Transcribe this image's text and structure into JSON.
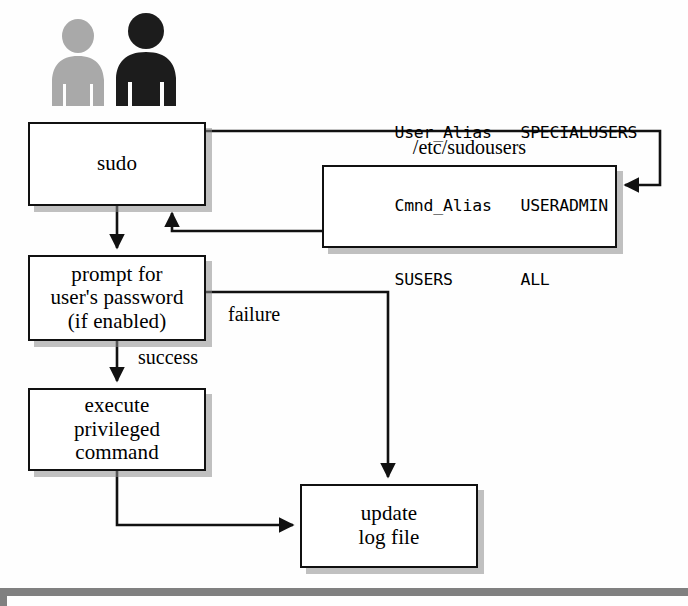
{
  "diagram": {
    "actors": [
      {
        "name": "user-light",
        "tone": "#a8a8a8"
      },
      {
        "name": "user-dark",
        "tone": "#1a1a1a"
      }
    ],
    "nodes": {
      "sudo": {
        "lines": [
          "sudo"
        ]
      },
      "prompt": {
        "lines": [
          "prompt for",
          "user's password",
          "(if enabled)"
        ]
      },
      "execute": {
        "lines": [
          "execute",
          "privileged",
          "command"
        ]
      },
      "update": {
        "lines": [
          "update",
          "log file"
        ]
      }
    },
    "sudoers": {
      "caption": "/etc/sudousers",
      "rows": [
        {
          "col1": "User_Alias",
          "col2": "SPECIALUSERS"
        },
        {
          "col1": "Cmnd_Alias",
          "col2": "USERADMIN"
        },
        {
          "col1": "SUSERS",
          "col2": "ALL"
        }
      ]
    },
    "edge_labels": {
      "failure": "failure",
      "success": "success"
    },
    "colors": {
      "stroke": "#111111",
      "box_fill": "#ffffff",
      "shadow": "#8c8c8c",
      "background": "#fefefe",
      "footer_bar": "#808080"
    }
  }
}
